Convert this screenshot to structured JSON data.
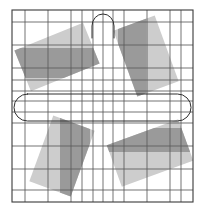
{
  "figure": {
    "canvas": {
      "width": 205,
      "height": 212,
      "background": "#ffffff"
    },
    "frame": {
      "name": "outer-square-border",
      "x": 12,
      "y": 10,
      "width": 181,
      "height": 192,
      "stroke": "#3a3a3a",
      "stroke_width": 1.1,
      "fill": "none"
    },
    "grid": {
      "stroke": "#5a5a5a",
      "stroke_width": 0.85,
      "vertical_lines": [
        12,
        25,
        48,
        71,
        82,
        93,
        103,
        113,
        124,
        147,
        170,
        181,
        193
      ],
      "horizontal_lines": [
        10,
        22,
        45,
        68,
        80,
        91,
        101,
        112,
        123,
        146,
        169,
        190,
        202
      ]
    },
    "shapes": [
      {
        "name": "rect-top-left",
        "quadrant": "top-left",
        "rotation_deg": -22,
        "center_x": 57,
        "center_y": 57,
        "width": 74,
        "height": 44,
        "fill_light": "#cdcdcd",
        "fill_dark": "#9a9a9a",
        "band_top": 48,
        "band_bottom": 78
      },
      {
        "name": "rect-top-right",
        "quadrant": "top-right",
        "rotation_deg": 70,
        "center_x": 146,
        "center_y": 56,
        "width": 70,
        "height": 44,
        "fill_light": "#cdcdcd",
        "fill_dark": "#9a9a9a",
        "band_left": 118,
        "band_right": 146
      },
      {
        "name": "rect-bottom-left",
        "quadrant": "bottom-left",
        "rotation_deg": -70,
        "center_x": 62,
        "center_y": 156,
        "width": 70,
        "height": 44,
        "fill_light": "#cdcdcd",
        "fill_dark": "#9a9a9a",
        "band_left": 60,
        "band_right": 90
      },
      {
        "name": "rect-bottom-right",
        "quadrant": "bottom-right",
        "rotation_deg": -20,
        "center_x": 150,
        "center_y": 153,
        "width": 76,
        "height": 44,
        "fill_light": "#cdcdcd",
        "fill_dark": "#9a9a9a",
        "band_top": 128,
        "band_bottom": 152
      }
    ],
    "outlines": [
      {
        "name": "center-capsule-outline",
        "shape": "stadium",
        "x": 14,
        "y": 94,
        "width": 177,
        "height": 27,
        "radius": 13.5,
        "stroke": "#2e2e2e",
        "stroke_width": 1.0,
        "fill": "none"
      },
      {
        "name": "top-dome-arc",
        "shape": "arc",
        "cx": 103,
        "cy": 26,
        "rx": 11,
        "ry": 12,
        "stroke": "#2e2e2e",
        "stroke_width": 1.0,
        "fill": "none"
      }
    ],
    "legend": {
      "light_swatch_label": "light gray fill",
      "dark_swatch_label": "dark gray overlap",
      "grid_label": "grid lines",
      "border_label": "outer border"
    }
  }
}
